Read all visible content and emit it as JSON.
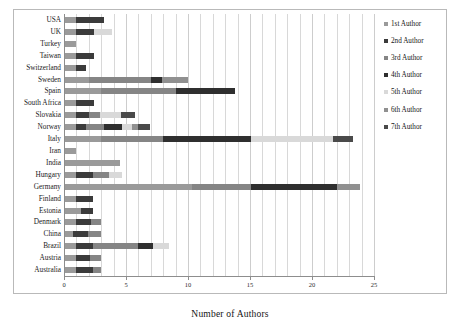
{
  "chart_data": {
    "type": "bar",
    "orientation": "horizontal",
    "stacked": true,
    "title": "",
    "xlabel": "Number of Authors",
    "ylabel": "",
    "xlim": [
      0,
      25
    ],
    "xticks": [
      0,
      5,
      10,
      15,
      20,
      25
    ],
    "xtick_labels": [
      "0",
      "5",
      "10",
      "15",
      "20",
      "25"
    ],
    "grid": true,
    "grid_axis": "x",
    "legend_position": "right",
    "categories": [
      "USA",
      "UK",
      "Turkey",
      "Taiwan",
      "Switzerland",
      "Sweden",
      "Spain",
      "South Africa",
      "Slovakia",
      "Norway",
      "Italy",
      "Iran",
      "India",
      "Hungary",
      "Germany",
      "Finland",
      "Estonia",
      "Denmark",
      "China",
      "Brazil",
      "Austria",
      "Australia"
    ],
    "series": [
      {
        "name": "1st Author",
        "color": "#9a9a9a",
        "values": [
          1,
          1,
          1,
          1,
          1,
          2,
          3,
          1,
          1,
          1,
          3,
          1,
          4.5,
          1,
          10.3,
          1,
          1.4,
          1,
          0.7,
          1,
          1,
          1
        ]
      },
      {
        "name": "2nd Author",
        "color": "#3b3b3b",
        "values": [
          2.2,
          1.4,
          0,
          1.4,
          0.8,
          0,
          0,
          1.4,
          1,
          0.8,
          0,
          0,
          0,
          1.3,
          0,
          1.3,
          0.9,
          1.2,
          1.2,
          1.3,
          1.1,
          1.3
        ]
      },
      {
        "name": "3rd Author",
        "color": "#858585",
        "values": [
          0,
          0,
          0,
          0,
          0,
          5,
          6,
          0,
          0.9,
          1.4,
          5,
          0,
          0,
          1.3,
          4.8,
          0,
          0,
          0.8,
          1.1,
          3.7,
          0.9,
          0.7
        ]
      },
      {
        "name": "4th Author",
        "color": "#2f2f2f",
        "values": [
          0,
          0,
          0,
          0,
          0,
          0.9,
          4.8,
          0,
          0,
          1.5,
          7.1,
          0,
          0,
          0,
          6.9,
          0,
          0,
          0,
          0,
          1.2,
          0,
          0
        ]
      },
      {
        "name": "5th Author",
        "color": "#d9d9d9",
        "values": [
          0,
          1.5,
          0,
          0,
          0,
          0,
          0,
          0,
          1.7,
          0.8,
          6.6,
          0,
          0,
          1.1,
          0,
          0,
          0,
          0,
          0,
          1.3,
          0,
          0
        ]
      },
      {
        "name": "6th Author",
        "color": "#909090",
        "values": [
          0,
          0,
          0,
          0,
          0,
          2.1,
          0,
          0,
          0,
          0.5,
          0,
          0,
          0,
          0,
          1.9,
          0,
          0,
          0,
          0,
          0,
          0,
          0
        ]
      },
      {
        "name": "7th Author",
        "color": "#4a4a4a",
        "values": [
          0,
          0,
          0,
          0,
          0,
          0,
          0,
          0,
          1.1,
          0.9,
          1.6,
          0,
          0,
          0,
          0,
          0,
          0,
          0,
          0,
          0,
          0,
          0
        ]
      }
    ]
  },
  "legend": {
    "entries": [
      {
        "label": "1st Author",
        "color": "#9a9a9a"
      },
      {
        "label": "2nd Author",
        "color": "#3b3b3b"
      },
      {
        "label": "3rd Author",
        "color": "#858585"
      },
      {
        "label": "4th Author",
        "color": "#2f2f2f"
      },
      {
        "label": "5th Author",
        "color": "#d9d9d9"
      },
      {
        "label": "6th Author",
        "color": "#909090"
      },
      {
        "label": "7th Author",
        "color": "#4a4a4a"
      }
    ]
  }
}
